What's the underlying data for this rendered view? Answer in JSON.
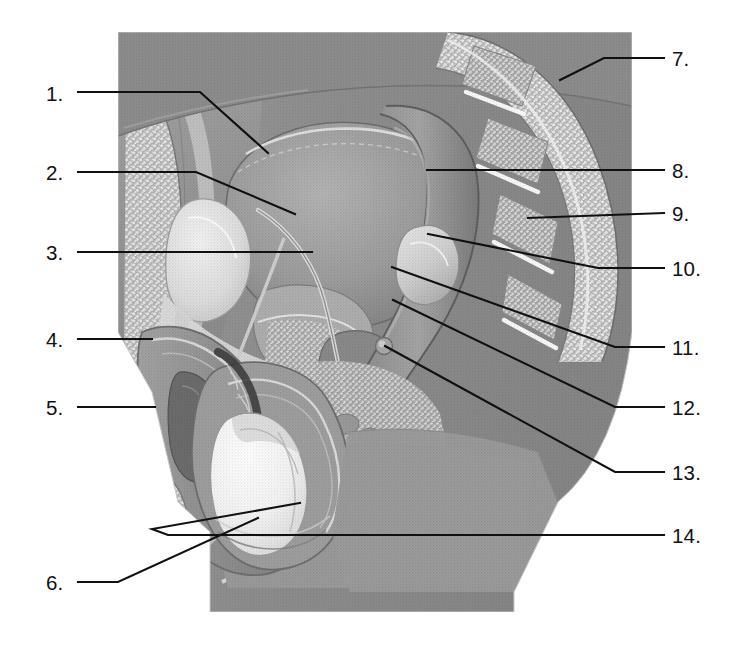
{
  "document": {
    "kind": "anatomical-illustration",
    "title": "Male reproductive system, midsagittal section",
    "style": "grayscale halftone medical illustration",
    "background_color": "#ffffff",
    "line_color": "#101010",
    "figure_bounds": {
      "x": 118,
      "y": 32,
      "width": 514,
      "height": 580
    }
  },
  "labels": [
    {
      "number": "1.",
      "side": "left",
      "x": 46,
      "y": 84,
      "leader": "M 78 92 L 200 92 L 268 153"
    },
    {
      "number": "2.",
      "side": "left",
      "x": 46,
      "y": 163,
      "leader": "M 78 172 L 196 172 L 295 214"
    },
    {
      "number": "3.",
      "side": "left",
      "x": 46,
      "y": 243,
      "leader": "M 78 252 L 312 252"
    },
    {
      "number": "4.",
      "side": "left",
      "x": 46,
      "y": 330,
      "leader": "M 78 339 L 152 339"
    },
    {
      "number": "5.",
      "side": "left",
      "x": 46,
      "y": 398,
      "leader": "M 78 407 L 155 407"
    },
    {
      "number": "6.",
      "side": "left",
      "x": 46,
      "y": 573,
      "leader": "M 78 582 L 118 582 L 258 518"
    },
    {
      "number": "7.",
      "side": "right",
      "x": 672,
      "y": 49,
      "leader": "M 664 58 L 604 58 L 560 80"
    },
    {
      "number": "8.",
      "side": "right",
      "x": 672,
      "y": 161,
      "leader": "M 664 170 L 427 170"
    },
    {
      "number": "9.",
      "side": "right",
      "x": 672,
      "y": 204,
      "leader": "M 664 213 L 528 218"
    },
    {
      "number": "10.",
      "side": "right",
      "x": 672,
      "y": 259,
      "leader": "M 664 268 L 598 268 L 428 234"
    },
    {
      "number": "11.",
      "side": "right",
      "x": 672,
      "y": 338,
      "leader": "M 664 347 L 615 347 L 392 267"
    },
    {
      "number": "12.",
      "side": "right",
      "x": 672,
      "y": 398,
      "leader": "M 664 407 L 615 407 L 393 300"
    },
    {
      "number": "13.",
      "side": "right",
      "x": 672,
      "y": 463,
      "leader": "M 664 472 L 615 472 L 385 346"
    },
    {
      "number": "14.",
      "side": "right",
      "x": 672,
      "y": 526,
      "leader": "M 664 535 L 168 535 L 152 529 L 300 503"
    }
  ]
}
